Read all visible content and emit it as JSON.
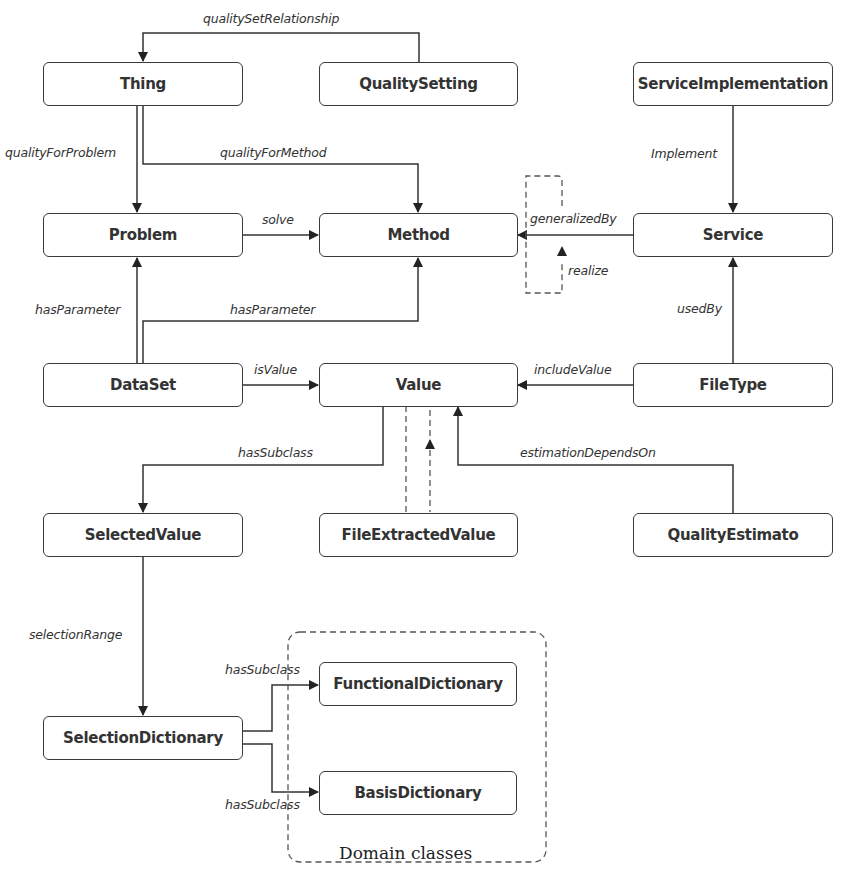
{
  "diagram": {
    "nodes": {
      "thing": "Thing",
      "quality_setting": "QualitySetting",
      "service_implementation": "ServiceImplementation",
      "problem": "Problem",
      "method": "Method",
      "service": "Service",
      "dataset": "DataSet",
      "value": "Value",
      "file_type": "FileType",
      "selected_value": "SelectedValue",
      "file_extracted_value": "FileExtractedValue",
      "quality_estimato": "QualityEstimato",
      "selection_dictionary": "SelectionDictionary",
      "functional_dictionary": "FunctionalDictionary",
      "basis_dictionary": "BasisDictionary"
    },
    "edges": {
      "quality_set_relationship": "qualitySetRelationship",
      "quality_for_problem": "qualityForProblem",
      "quality_for_method": "qualityForMethod",
      "implement": "Implement",
      "solve": "solve",
      "generalized_by": "generalizedBy",
      "realize": "realize",
      "has_parameter_problem": "hasParameter",
      "has_parameter_method": "hasParameter",
      "used_by": "usedBy",
      "is_value": "isValue",
      "include_value": "includeValue",
      "has_subclass_selected": "hasSubclass",
      "estimation_depends_on": "estimationDependsOn",
      "selection_range": "selectionRange",
      "has_subclass_functional": "hasSubclass",
      "has_subclass_basis": "hasSubclass"
    },
    "groups": {
      "domain_classes": "Domain classes"
    },
    "colors": {
      "stroke": "#3a3a3a",
      "dashed": "#555555",
      "text": "#333333"
    }
  }
}
